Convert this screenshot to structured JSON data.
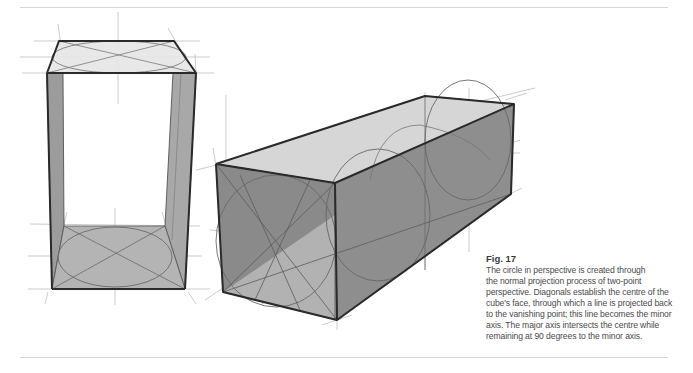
{
  "figure": {
    "label": "Fig. 17",
    "caption_lines": [
      "The circle in perspective is created through",
      "the normal projection process of two-point",
      "perspective. Diagonals establish the centre of the",
      "cube's face, through which a line is projected back",
      "to the vanishing point; this line becomes the minor",
      "axis. The major axis intersects the centre while",
      "remaining at 90 degrees to the minor axis."
    ],
    "illustrations": [
      {
        "name": "vertical-open-box",
        "description": "Vertical box in perspective with circles inscribed in top and bottom faces"
      },
      {
        "name": "horizontal-box",
        "description": "Horizontal box in two-point perspective with circles inscribed in faces, diagonals and axes"
      }
    ]
  },
  "colors": {
    "rule": "#d6d6d6",
    "face_light": "#dcdcdc",
    "face_mid": "#b4b4b4",
    "face_dark": "#8a8a8a",
    "edge": "#2a2a2a",
    "guide": "#9a9a9a",
    "text": "#4a4a4a"
  }
}
